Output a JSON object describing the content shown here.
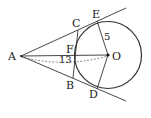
{
  "diagram": {
    "type": "geometry",
    "labels": {
      "A": "A",
      "B": "B",
      "C": "C",
      "D": "D",
      "E": "E",
      "F": "F",
      "O": "O"
    },
    "measurements": {
      "radius_OE": "5",
      "distance_AO": "13"
    },
    "colors": {
      "stroke": "#333333",
      "background": "#ffffff"
    }
  }
}
